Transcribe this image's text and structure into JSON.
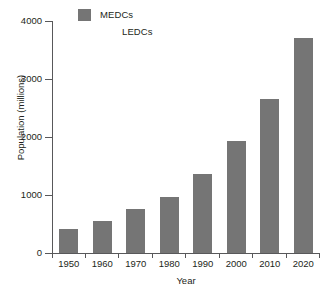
{
  "chart_data": {
    "type": "bar",
    "title": "",
    "subtitle": "",
    "xlabel": "Year",
    "ylabel": "Population (millions)",
    "categories": [
      "1950",
      "1960",
      "1970",
      "1980",
      "1990",
      "2000",
      "2010",
      "2020"
    ],
    "series": [
      {
        "name": "MEDCs",
        "color": "#757575",
        "values": [
          420,
          560,
          760,
          960,
          1360,
          1940,
          2650,
          3700
        ]
      }
    ],
    "ylim": [
      0,
      4000
    ],
    "yticks": [
      0,
      1000,
      2000,
      3000,
      4000
    ],
    "ytick_labels": [
      "0",
      "1000",
      "2000",
      "3000",
      "4000"
    ],
    "xlim_categories": 8,
    "grid": false,
    "legend_position": "top-left",
    "legend": [
      {
        "label": "MEDCs",
        "swatch": "filled",
        "color": "#757575"
      },
      {
        "label": "LEDCs",
        "swatch": "empty",
        "color": "#ffffff"
      }
    ]
  },
  "colors": {
    "bar": "#757575",
    "axis": "#58585a",
    "text": "#231f20",
    "background": "#ffffff"
  }
}
